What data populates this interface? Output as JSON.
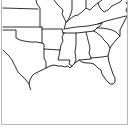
{
  "map": {
    "region": "Southeastern United States",
    "style": "state outline",
    "colors": {
      "background": "#ffffff",
      "border": "#1a1a1a",
      "frame": "#b8b8b8"
    },
    "states_visible": [
      "Kansas",
      "Missouri",
      "Oklahoma",
      "Arkansas",
      "Texas",
      "Louisiana",
      "Kentucky",
      "Tennessee",
      "Mississippi",
      "Alabama",
      "Georgia",
      "Florida",
      "South Carolina",
      "North Carolina",
      "Virginia",
      "West Virginia",
      "Illinois",
      "Indiana",
      "Ohio"
    ]
  }
}
